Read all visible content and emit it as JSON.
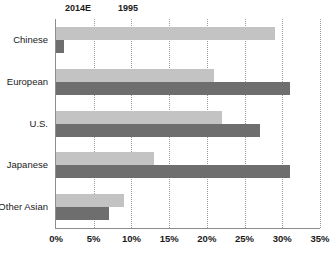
{
  "chart_data": {
    "type": "bar",
    "orientation": "horizontal",
    "title": "",
    "xlabel": "",
    "ylabel": "",
    "categories": [
      "Chinese",
      "European",
      "U.S.",
      "Japanese",
      "Other Asian"
    ],
    "series": [
      {
        "name": "2014E",
        "color": "#c3c3c3",
        "values": [
          29,
          21,
          22,
          13,
          9
        ]
      },
      {
        "name": "1995",
        "color": "#6e6e6e",
        "values": [
          1,
          31,
          27,
          31,
          7
        ]
      }
    ],
    "xlim": [
      0,
      35
    ],
    "xticks": [
      0,
      5,
      10,
      15,
      20,
      25,
      30,
      35
    ],
    "xtick_labels": [
      "0%",
      "5%",
      "10%",
      "15%",
      "20%",
      "25%",
      "30%",
      "35%"
    ],
    "grid": "vertical-dotted",
    "legend_position": "top-left",
    "value_unit": "%"
  },
  "legend": {
    "items": [
      {
        "label": "2014E",
        "swatch_name": "legend-swatch-2014e"
      },
      {
        "label": "1995",
        "swatch_name": "legend-swatch-1995"
      }
    ]
  },
  "axis": {
    "line_color": "#8d8d8d",
    "gridline_color": "#9a9a9a"
  },
  "footer": {
    "clipped_text": ""
  }
}
